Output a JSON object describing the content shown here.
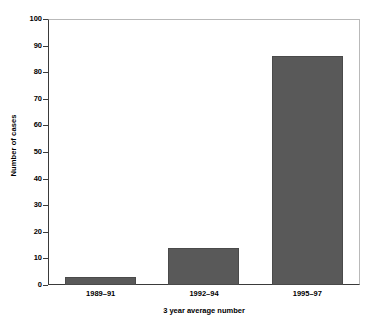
{
  "chart_data": {
    "type": "bar",
    "title": "",
    "categories": [
      "1989–91",
      "1992–94",
      "1995–97"
    ],
    "values": [
      3,
      14,
      86.5
    ],
    "xlabel": "3 year average number",
    "ylabel": "Number of cases",
    "ylim": [
      0,
      100
    ],
    "ytick_labels": [
      "0",
      "10",
      "20",
      "30",
      "40",
      "50",
      "60",
      "70",
      "80",
      "90",
      "100"
    ],
    "ytick_values": [
      0,
      10,
      20,
      30,
      40,
      50,
      60,
      70,
      80,
      90,
      100
    ],
    "grid": false,
    "legend": "none",
    "bar_color": "#595959",
    "axis_color": "#3a3a3a",
    "frame_color": "#b9b9b9",
    "background_color": "#ffffff"
  }
}
